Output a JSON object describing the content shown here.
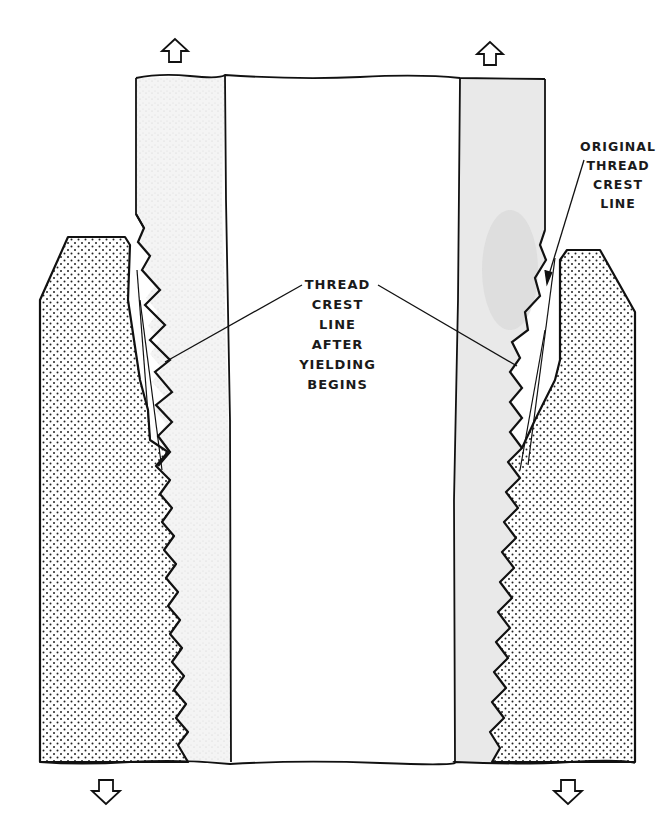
{
  "diagram": {
    "type": "cross-section",
    "labels": {
      "original_crest": [
        "ORIGINAL",
        "THREAD",
        "CREST",
        "LINE"
      ],
      "after_yield": [
        "THREAD",
        "CREST",
        "LINE",
        "AFTER",
        "YIELDING",
        "BEGINS"
      ]
    },
    "arrows": {
      "top_left": "up-arrow",
      "top_right": "up-arrow",
      "bottom_left": "down-arrow",
      "bottom_right": "down-arrow"
    },
    "colors": {
      "line": "#111111",
      "stipple": "#222222",
      "pipe_wall_shade": "#e6e6e6",
      "background": "#ffffff"
    }
  }
}
